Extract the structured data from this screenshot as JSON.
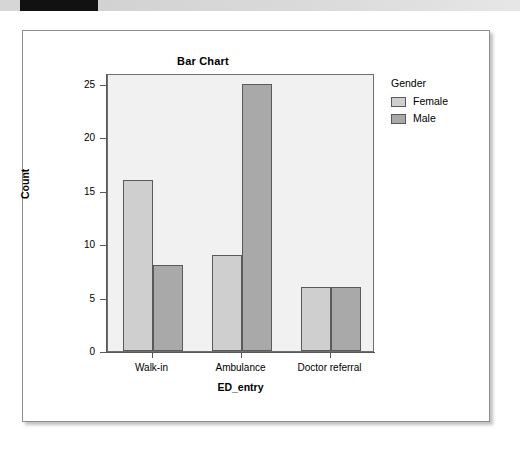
{
  "banner": {
    "left_block_name": "black-marker-block"
  },
  "chart_data": {
    "type": "bar",
    "title": "Bar Chart",
    "xlabel": "ED_entry",
    "ylabel": "Count",
    "categories": [
      "Walk-in",
      "Ambulance",
      "Doctor referral"
    ],
    "series": [
      {
        "name": "Female",
        "color": "#cfcfcf",
        "values": [
          16,
          9,
          6
        ]
      },
      {
        "name": "Male",
        "color": "#a9a9a9",
        "values": [
          8,
          25,
          6
        ]
      }
    ],
    "ylim": [
      0,
      26
    ],
    "yticks": [
      0,
      5,
      10,
      15,
      20,
      25
    ],
    "ytick_labels": [
      "0",
      "5",
      "10",
      "15",
      "20",
      "25"
    ],
    "grid": false,
    "legend_title": "Gender",
    "legend_position": "right",
    "plot_background": "#f1f1f1",
    "axis_color": "#585858",
    "bar_edge_color": "#5a5a5a"
  }
}
